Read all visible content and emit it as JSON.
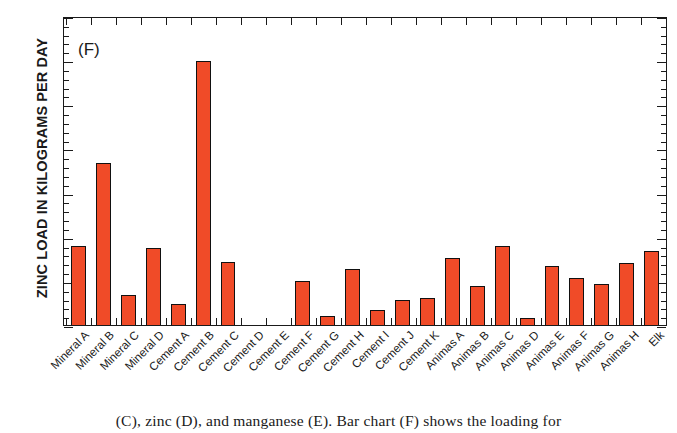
{
  "chart_data": {
    "type": "bar",
    "title": "",
    "panel_label": "(F)",
    "xlabel": "",
    "ylabel": "ZINC LOAD IN KILOGRAMS PER DAY",
    "ylim": [
      0,
      70
    ],
    "ytick_values": [
      0,
      10,
      20,
      30,
      40,
      50,
      60,
      70
    ],
    "ytick_labels": [
      "0",
      "10",
      "20",
      "30",
      "40",
      "50",
      "60",
      "70"
    ],
    "ytick_minor_step": 2,
    "grid": false,
    "legend": "none",
    "bar_color": "#f04b28",
    "bar_edge_color": "#111111",
    "categories": [
      "Mineral A",
      "Mineral B",
      "Mineral C",
      "Mineral D",
      "Cement A",
      "Cement B",
      "Cement C",
      "Cement D",
      "Cement E",
      "Cement F",
      "Cement G",
      "Cement H",
      "Cement I",
      "Cement J",
      "Cement K",
      "Animas A",
      "Animas B",
      "Animas C",
      "Animas D",
      "Animas E",
      "Animas F",
      "Animas G",
      "Animas H",
      "Elk"
    ],
    "values": [
      18.0,
      36.6,
      6.9,
      17.4,
      4.8,
      59.7,
      14.2,
      0.0,
      0.0,
      9.9,
      2.1,
      12.6,
      3.4,
      5.6,
      6.1,
      15.2,
      8.8,
      18.0,
      1.6,
      13.3,
      10.6,
      9.3,
      14.0,
      16.8
    ]
  },
  "caption": {
    "text": "(C), zinc (D), and manganese (E). Bar chart (F) shows the loading for"
  }
}
